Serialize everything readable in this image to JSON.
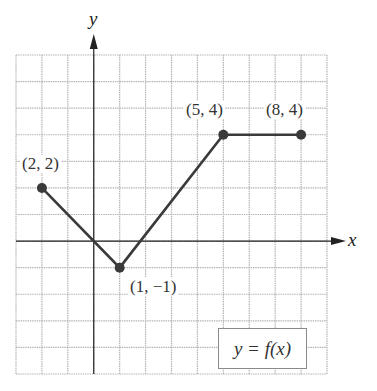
{
  "chart_data": {
    "type": "line",
    "title": "",
    "xlabel": "x",
    "ylabel": "y",
    "function_label": "y = f(x)",
    "xlim": [
      -3,
      9
    ],
    "ylim": [
      -5,
      7
    ],
    "grid": true,
    "grid_step": 1,
    "series": [
      {
        "name": "f(x)",
        "points": [
          {
            "x": -2,
            "y": 2,
            "label": "(2, 2)"
          },
          {
            "x": 1,
            "y": -1,
            "label": "(1, −1)"
          },
          {
            "x": 5,
            "y": 4,
            "label": "(5, 4)"
          },
          {
            "x": 8,
            "y": 4,
            "label": "(8, 4)"
          }
        ]
      }
    ],
    "colors": {
      "line": "#3a3a3a",
      "grid": "#b5b5b5",
      "axis": "#222222"
    }
  },
  "labels": {
    "x_axis": "x",
    "y_axis": "y",
    "function": "y = f(x)",
    "p1": "(2, 2)",
    "p2": "(1, −1)",
    "p3": "(5, 4)",
    "p4": "(8, 4)"
  }
}
